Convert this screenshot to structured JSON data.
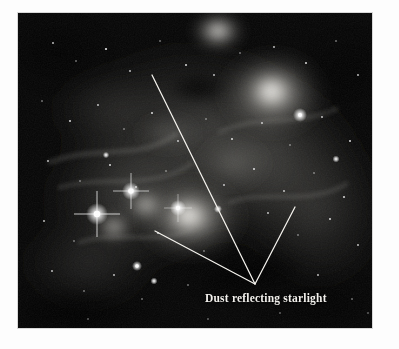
{
  "figure": {
    "kind": "astronomical-photograph",
    "background_color": "#050505",
    "page_background": "#fdfdfd",
    "annotation": {
      "label": "Dust reflecting starlight",
      "label_color": "#f2f0ec",
      "leader_line_color": "#f5f3ee",
      "leader_vertex": {
        "x": 255,
        "y": 284
      },
      "leader_endpoints": [
        {
          "name": "upper-left-pointer",
          "x": 152,
          "y": 75
        },
        {
          "name": "left-pointer",
          "x": 155,
          "y": 231
        },
        {
          "name": "upper-right-pointer",
          "x": 295,
          "y": 207
        }
      ]
    },
    "bright_features": [
      {
        "name": "top-edge-glow",
        "x": 200,
        "y": 20,
        "radius": 26,
        "intensity": 0.95
      },
      {
        "name": "main-nebula-blob",
        "x": 255,
        "y": 80,
        "radius": 48,
        "intensity": 0.9
      },
      {
        "name": "central-glow",
        "x": 175,
        "y": 205,
        "radius": 52,
        "intensity": 0.88
      },
      {
        "name": "bright-star-lower-left",
        "x": 97,
        "y": 215,
        "radius": 9,
        "intensity": 1.0
      },
      {
        "name": "bright-star-mid-left",
        "x": 130,
        "y": 192,
        "radius": 8,
        "intensity": 0.95
      },
      {
        "name": "bright-star-right",
        "x": 300,
        "y": 115,
        "radius": 5,
        "intensity": 1.0
      },
      {
        "name": "star-lower-left",
        "x": 137,
        "y": 266,
        "radius": 4,
        "intensity": 0.9
      }
    ],
    "dark_features": [
      {
        "name": "dust-lane-center",
        "x": 240,
        "y": 258,
        "rx": 48,
        "ry": 20
      },
      {
        "name": "dark-patch-upper",
        "x": 180,
        "y": 78,
        "rx": 26,
        "ry": 14
      }
    ]
  }
}
